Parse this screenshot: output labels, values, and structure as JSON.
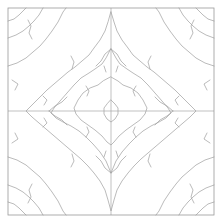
{
  "figure": {
    "background": "#ffffff",
    "width": 222,
    "height": 223
  },
  "frame": {
    "name": "plot-frame",
    "x0": 8,
    "y0": 8,
    "x1": 214,
    "y1": 215,
    "color": "#9a9a9a",
    "stroke_width": 0.8
  },
  "axes_lines": {
    "color": "#a8a8a8",
    "stroke_width": 0.7,
    "vertical_x": 111,
    "horizontal_y": 111
  },
  "contours": {
    "color": "#9d9d9d",
    "stroke_width": 0.7,
    "fill": "none"
  },
  "chart_data": {
    "type": "contour",
    "title": "",
    "xlabel": "",
    "ylabel": "",
    "grid": false,
    "legend": null,
    "symmetry": "4-fold mirror (horizontal and vertical axes)",
    "center": [
      111,
      111
    ],
    "xlim": [
      8,
      214
    ],
    "ylim": [
      8,
      215
    ],
    "levels": [
      {
        "name": "level-0-center",
        "kind": "closed-polygon",
        "half_width": 7,
        "half_height": 11,
        "saddle": false
      },
      {
        "name": "level-1-inner-diamond",
        "kind": "closed-diamond",
        "half_width": 36,
        "half_height": 34,
        "saddle": false
      },
      {
        "name": "level-2-mid-diamond",
        "kind": "closed-diamond",
        "half_width": 62,
        "half_height": 58,
        "saddle": true
      },
      {
        "name": "level-3-outer-diamond",
        "kind": "closed-diamond",
        "half_width": 88,
        "half_height": 84,
        "saddle": true
      },
      {
        "name": "level-4-corner-band-a",
        "kind": "open-diagonal",
        "offset": 104
      },
      {
        "name": "level-5-corner-band-b",
        "kind": "open-diagonal",
        "offset": 132
      },
      {
        "name": "level-6-corner-band-c",
        "kind": "open-diagonal",
        "offset": 160
      },
      {
        "name": "level-7-corner-band-d",
        "kind": "open-diagonal",
        "offset": 186
      }
    ],
    "saddle_points": [
      [
        111,
        49
      ],
      [
        111,
        173
      ],
      [
        49,
        111
      ],
      [
        173,
        111
      ]
    ]
  }
}
